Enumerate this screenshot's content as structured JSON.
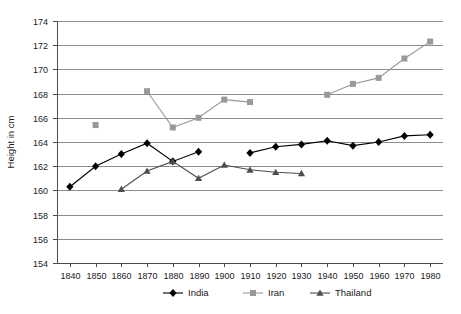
{
  "chart_data": {
    "type": "line",
    "title": "",
    "xlabel": "",
    "ylabel": "Height in cm",
    "xlim": [
      1835,
      1985
    ],
    "ylim": [
      154,
      174
    ],
    "ytick_step": 2,
    "grid": true,
    "legend_position": "bottom",
    "x": [
      1840,
      1850,
      1860,
      1870,
      1880,
      1890,
      1900,
      1910,
      1920,
      1930,
      1940,
      1950,
      1960,
      1970,
      1980
    ],
    "xtick_labels": [
      "1840",
      "1850",
      "1860",
      "1870",
      "1880",
      "1890",
      "1900",
      "1910",
      "1920",
      "1930",
      "1940",
      "1950",
      "1960",
      "1970",
      "1980"
    ],
    "ytick_labels": [
      "154",
      "156",
      "158",
      "160",
      "162",
      "164",
      "166",
      "168",
      "170",
      "172",
      "174"
    ],
    "series": [
      {
        "name": "India",
        "color": "#000000",
        "marker": "diamond",
        "points": [
          {
            "x": 1840,
            "y": 160.3
          },
          {
            "x": 1850,
            "y": 162.0
          },
          {
            "x": 1860,
            "y": 163.0
          },
          {
            "x": 1870,
            "y": 163.9
          },
          {
            "x": 1880,
            "y": 162.4
          },
          {
            "x": 1890,
            "y": 163.2
          },
          {
            "x": 1910,
            "y": 163.1
          },
          {
            "x": 1920,
            "y": 163.6
          },
          {
            "x": 1930,
            "y": 163.8
          },
          {
            "x": 1940,
            "y": 164.1
          },
          {
            "x": 1950,
            "y": 163.7
          },
          {
            "x": 1960,
            "y": 164.0
          },
          {
            "x": 1970,
            "y": 164.5
          },
          {
            "x": 1980,
            "y": 164.6
          }
        ]
      },
      {
        "name": "Iran",
        "color": "#999999",
        "marker": "square",
        "points": [
          {
            "x": 1850,
            "y": 165.4
          },
          {
            "x": 1870,
            "y": 168.2
          },
          {
            "x": 1880,
            "y": 165.2
          },
          {
            "x": 1890,
            "y": 166.0
          },
          {
            "x": 1900,
            "y": 167.5
          },
          {
            "x": 1910,
            "y": 167.3
          },
          {
            "x": 1940,
            "y": 167.9
          },
          {
            "x": 1950,
            "y": 168.8
          },
          {
            "x": 1960,
            "y": 169.3
          },
          {
            "x": 1970,
            "y": 170.9
          },
          {
            "x": 1980,
            "y": 172.3
          }
        ]
      },
      {
        "name": "Thailand",
        "color": "#4d4d4d",
        "marker": "triangle",
        "points": [
          {
            "x": 1860,
            "y": 160.1
          },
          {
            "x": 1870,
            "y": 161.6
          },
          {
            "x": 1880,
            "y": 162.4
          },
          {
            "x": 1890,
            "y": 161.0
          },
          {
            "x": 1900,
            "y": 162.1
          },
          {
            "x": 1910,
            "y": 161.7
          },
          {
            "x": 1920,
            "y": 161.5
          },
          {
            "x": 1930,
            "y": 161.4
          }
        ]
      }
    ]
  },
  "legend": {
    "items": [
      {
        "label": "India"
      },
      {
        "label": "Iran"
      },
      {
        "label": "Thailand"
      }
    ]
  }
}
